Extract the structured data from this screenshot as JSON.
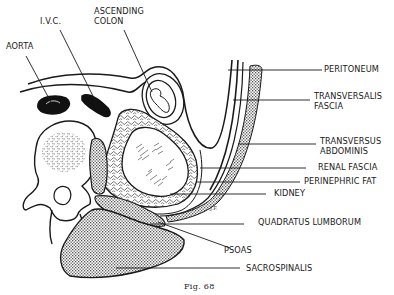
{
  "figure": {
    "caption": "Fig. 68"
  },
  "labels": {
    "aorta": "AORTA",
    "ivc": "I.V.C.",
    "ascending_colon_1": "ASCENDING",
    "ascending_colon_2": "COLON",
    "peritoneum": "PERITONEUM",
    "transversalis_fascia_1": "TRANSVERSALIS",
    "transversalis_fascia_2": "FASCIA",
    "transversus_abdominis_1": "TRANSVERSUS",
    "transversus_abdominis_2": "ABDOMINIS",
    "renal_fascia": "RENAL FASCIA",
    "perinephric_fat": "PERINEPHRIC FAT",
    "kidney": "KIDNEY",
    "quadratus_lumborum": "QUADRATUS LUMBORUM",
    "psoas": "PSOAS",
    "sacrospinalis": "SACROSPINALIS"
  },
  "colors": {
    "ink": "#1a1a1a",
    "paper": "#ffffff",
    "stipple": "#8a8a8a"
  }
}
